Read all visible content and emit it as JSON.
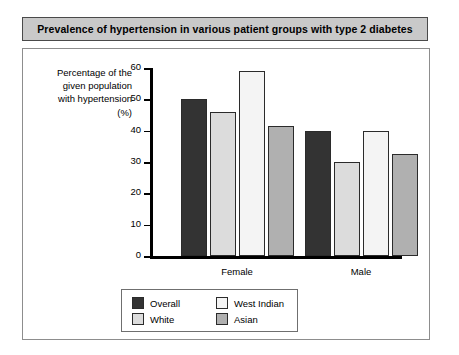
{
  "title": "Prevalence of hypertension in various patient groups with type 2 diabetes",
  "axis_title_lines": [
    "Percentage of the",
    "given population",
    "with hypertension",
    "(%)"
  ],
  "colors": {
    "overall": "#333333",
    "white": "#dcdcdc",
    "west_indian": "#f4f4f4",
    "asian": "#b0b0b0",
    "title_bar": "#c9c9c9",
    "axis": "#000000",
    "bar_outline": "#2b2b2b"
  },
  "chart_data": {
    "type": "bar",
    "title": "Prevalence of hypertension in various patient groups with type 2 diabetes",
    "xlabel": "",
    "ylabel": "Percentage of the given population with hypertension (%)",
    "categories": [
      "Female",
      "Male"
    ],
    "series": [
      {
        "name": "Overall",
        "values": [
          50,
          40
        ],
        "color": "#333333"
      },
      {
        "name": "White",
        "values": [
          46,
          30
        ],
        "color": "#dcdcdc"
      },
      {
        "name": "West Indian",
        "values": [
          59,
          40
        ],
        "color": "#f4f4f4"
      },
      {
        "name": "Asian",
        "values": [
          41.5,
          32.5
        ],
        "color": "#b0b0b0"
      }
    ],
    "ylim": [
      0,
      60
    ],
    "yticks": [
      0,
      10,
      20,
      30,
      40,
      50,
      60
    ],
    "ytick_labels": [
      "0",
      "10",
      "20",
      "30",
      "40",
      "50",
      "60"
    ],
    "grid": false,
    "legend_position": "bottom",
    "legend_order": [
      "Overall",
      "West Indian",
      "White",
      "Asian"
    ]
  }
}
